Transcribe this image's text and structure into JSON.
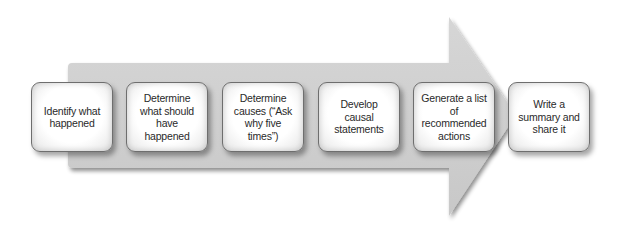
{
  "diagram": {
    "type": "process-arrow",
    "colors": {
      "arrow_fill": "#cfcfcf",
      "box_border": "#6e6e6e",
      "box_fill": "#ffffff",
      "text": "#2a2a2a"
    },
    "steps": [
      {
        "label": "Identify what happened"
      },
      {
        "label": "Determine what should have happened"
      },
      {
        "label": "Determine causes (“Ask why five times”)"
      },
      {
        "label": "Develop causal statements"
      },
      {
        "label": "Generate a list of recommended actions"
      },
      {
        "label": "Write a summary and share it"
      }
    ]
  }
}
